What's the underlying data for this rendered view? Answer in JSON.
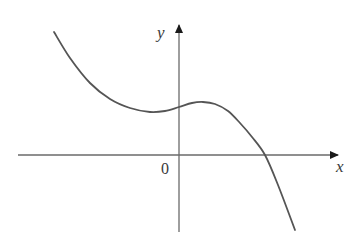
{
  "chart_data": {
    "type": "line",
    "title": "",
    "xlabel": "x",
    "ylabel": "y",
    "origin_label": "0",
    "grid": false,
    "legend": null,
    "series": [
      {
        "name": "f(x)",
        "color": "#555555",
        "points_px": [
          [
            54,
            32
          ],
          [
            70,
            58
          ],
          [
            90,
            83
          ],
          [
            110,
            99
          ],
          [
            130,
            108
          ],
          [
            150,
            112
          ],
          [
            165,
            111
          ],
          [
            179,
            107
          ],
          [
            192,
            103
          ],
          [
            203,
            102
          ],
          [
            215,
            104
          ],
          [
            228,
            111
          ],
          [
            240,
            123
          ],
          [
            252,
            137
          ],
          [
            265,
            155
          ],
          [
            278,
            185
          ],
          [
            295,
            230
          ]
        ]
      }
    ],
    "features": {
      "local_min_px": [
        150,
        112
      ],
      "y_intercept_px": [
        179,
        107
      ],
      "local_max_px": [
        203,
        102
      ],
      "x_intercept_px": [
        265,
        155
      ]
    },
    "axes": {
      "x_axis": {
        "from": [
          18,
          155
        ],
        "to": [
          338,
          155
        ]
      },
      "y_axis": {
        "from": [
          179,
          232
        ],
        "to": [
          179,
          25
        ]
      }
    }
  },
  "colors": {
    "axis": "#6a6a6a",
    "curve": "#555555",
    "text": "#3a3a3a"
  }
}
